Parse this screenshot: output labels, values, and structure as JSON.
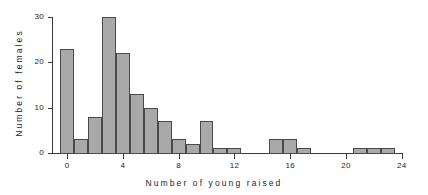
{
  "chart_data": {
    "type": "bar",
    "title": "",
    "subtitle": "",
    "xlabel": "Number of young raised",
    "ylabel": "Number of females",
    "categories": [
      0,
      1,
      2,
      3,
      4,
      5,
      6,
      7,
      8,
      9,
      10,
      11,
      12,
      13,
      14,
      15,
      16,
      17,
      18,
      19,
      20,
      21,
      22,
      23
    ],
    "values": [
      23,
      3,
      8,
      30,
      22,
      13,
      10,
      7,
      3,
      2,
      7,
      1,
      1,
      0,
      0,
      3,
      3,
      1,
      0,
      0,
      0,
      1,
      1,
      1
    ],
    "series": [
      {
        "name": "Number of females",
        "values": [
          23,
          3,
          8,
          30,
          22,
          13,
          10,
          7,
          3,
          2,
          7,
          1,
          1,
          0,
          0,
          3,
          3,
          1,
          0,
          0,
          0,
          1,
          1,
          1
        ]
      }
    ],
    "xlim": [
      -1,
      24
    ],
    "ylim": [
      0,
      30
    ],
    "xticks": [
      0,
      4,
      8,
      12,
      16,
      20,
      24
    ],
    "xtick_labels": [
      "0",
      "4",
      "8",
      "12",
      "16",
      "20",
      "24"
    ],
    "yticks": [
      0,
      10,
      20,
      30
    ],
    "ytick_labels": [
      "0",
      "10",
      "20",
      "30"
    ],
    "grid": false,
    "legend": false,
    "bar_fill_color": "#a9a9a9",
    "bar_edge_color": "#4a4a4a",
    "axis_color": "#3a3a3a",
    "background_color": "#ffffff",
    "bar_width": 1
  }
}
